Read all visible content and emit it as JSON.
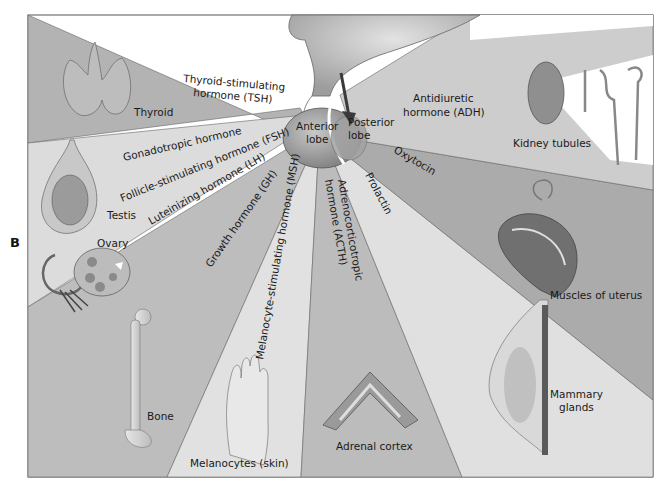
{
  "figure": {
    "panel_letter": "B",
    "colors": {
      "background": "#ffffff",
      "frame": "#555555",
      "sector_dark": "#a9a9a9",
      "sector_mid": "#bdbdbd",
      "sector_light": "#d9d9d9",
      "sector_lighter": "#e4e4e4",
      "pituitary": "#9a9a9a",
      "hypothalamus": "#c4c4c4",
      "arrow": "#3a3a3a"
    }
  },
  "pituitary": {
    "anterior_lobe": "Anterior",
    "anterior_lobe_2": "lobe",
    "posterior_lobe": "Posterior",
    "posterior_lobe_2": "lobe"
  },
  "hormones": {
    "tsh_1": "Thyroid-stimulating",
    "tsh_2": "hormone (TSH)",
    "gonadotropic": "Gonadotropic hormone",
    "fsh": "Follicle-stimulating hormone (FSH)",
    "lh": "Luteinizing hormone (LH)",
    "gh": "Growth hormone (GH)",
    "msh": "Melanocyte-stimulating hormone (MSH)",
    "acth_1": "Adrenocorticotropic",
    "acth_2": "hormone (ACTH)",
    "prolactin": "Prolactin",
    "oxytocin": "Oxytocin",
    "adh_1": "Antidiuretic",
    "adh_2": "hormone (ADH)"
  },
  "targets": {
    "thyroid": "Thyroid",
    "testis": "Testis",
    "ovary": "Ovary",
    "bone": "Bone",
    "melanocytes": "Melanocytes (skin)",
    "adrenal": "Adrenal cortex",
    "mammary_1": "Mammary",
    "mammary_2": "glands",
    "uterus": "Muscles of uterus",
    "kidney": "Kidney tubules"
  }
}
